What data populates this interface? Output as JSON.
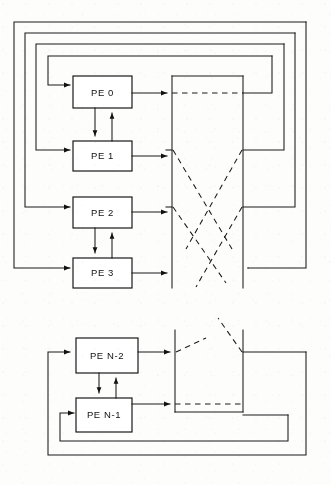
{
  "figure": {
    "background_color": "#fdfdfc",
    "line_color": "#1a1a1a",
    "width": 331,
    "height": 485
  },
  "nodes": [
    {
      "id": "pe0",
      "label": "PE 0",
      "x": 73,
      "y": 76,
      "w": 59,
      "h": 32,
      "section": "top"
    },
    {
      "id": "pe1",
      "label": "PE 1",
      "x": 73,
      "y": 141,
      "w": 59,
      "h": 30,
      "section": "top"
    },
    {
      "id": "pe2",
      "label": "PE 2",
      "x": 73,
      "y": 197,
      "w": 59,
      "h": 31,
      "section": "top"
    },
    {
      "id": "pe3",
      "label": "PE 3",
      "x": 73,
      "y": 258,
      "w": 59,
      "h": 30,
      "section": "top"
    },
    {
      "id": "pen2",
      "label": "PE N-2",
      "x": 76,
      "y": 338,
      "w": 62,
      "h": 35,
      "section": "bottom"
    },
    {
      "id": "pen1",
      "label": "PE N-1",
      "x": 76,
      "y": 398,
      "w": 56,
      "h": 34,
      "section": "bottom"
    }
  ],
  "pairs": [
    {
      "upper": "pe0",
      "lower": "pe1",
      "down_arrow": true,
      "up_arrow": true
    },
    {
      "upper": "pe2",
      "lower": "pe3",
      "down_arrow": true,
      "up_arrow": true
    },
    {
      "upper": "pen2",
      "lower": "pen1",
      "down_arrow": true,
      "up_arrow": true
    }
  ],
  "network": {
    "top_section": {
      "left_bus_x": 172,
      "right_bus_x": 243,
      "top_y": 76,
      "bottom_y": 288
    },
    "bottom_section": {
      "left_bus_x": 175,
      "right_bus_x": 243,
      "top_y": 330,
      "bottom_y": 412
    }
  },
  "feedback_loops": {
    "top": [
      {
        "level": 1,
        "left_x": 14,
        "top_y": 22,
        "right_x": 306,
        "bottom_y": 268
      },
      {
        "level": 2,
        "left_x": 25,
        "top_y": 33,
        "right_x": 295,
        "bottom_y": 207
      },
      {
        "level": 3,
        "left_x": 36,
        "top_y": 44,
        "right_x": 284,
        "bottom_y": 150
      },
      {
        "level": 4,
        "left_x": 48,
        "top_y": 56,
        "right_x": 272,
        "bottom_y": 85
      }
    ],
    "bottom": [
      {
        "level": 1,
        "left_x": 48,
        "top_y": 340,
        "right_x": 306,
        "bottom_y": 455
      },
      {
        "level": 2,
        "left_x": 60,
        "top_y": 405,
        "right_x": 288,
        "bottom_y": 441
      }
    ]
  },
  "labels": {
    "pe0": "PE 0",
    "pe1": "PE 1",
    "pe2": "PE 2",
    "pe3": "PE 3",
    "pen2": "PE N-2",
    "pen1": "PE N-1"
  },
  "legend": {
    "solid_meaning": "data path",
    "dashed_meaning": "switched network connection"
  }
}
